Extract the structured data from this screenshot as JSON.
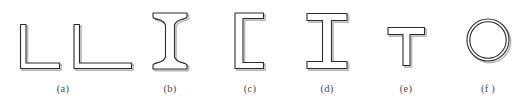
{
  "figure": {
    "background_color": "#ffffff",
    "outline_color": "#2b2b2b",
    "shadow_color": "#b9b9b9",
    "fill_color": "#ffffff",
    "stroke_width": 1.1,
    "width": 532,
    "height": 108
  },
  "captions": [
    {
      "id": "a",
      "label": "(a)",
      "x": 63,
      "shape_name": "angle-sections"
    },
    {
      "id": "b",
      "label": "(b)",
      "x": 170,
      "shape_name": "s-beam-section"
    },
    {
      "id": "c",
      "label": "(c)",
      "x": 250,
      "shape_name": "channel-section"
    },
    {
      "id": "d",
      "label": "(d)",
      "x": 327,
      "shape_name": "w-beam-section"
    },
    {
      "id": "e",
      "label": "(e)",
      "x": 406,
      "shape_name": "tee-section"
    },
    {
      "id": "f",
      "label": "(f )",
      "x": 488,
      "shape_name": "pipe-section"
    }
  ],
  "shapes": [
    {
      "name": "angle-equal-leg",
      "caption_id": "a",
      "description": "Equal-leg angle (L) cross section",
      "bbox": [
        19,
        24,
        41,
        45
      ],
      "path": "M 20.5 24.5 L 26.0 24.5 L 26.0 63.0 L 59.5 63.0 L 59.5 68.5 L 20.5 68.5 Z"
    },
    {
      "name": "angle-unequal-leg",
      "caption_id": "a",
      "description": "Unequal-leg angle (L) cross section",
      "bbox": [
        73,
        24,
        59,
        45
      ],
      "path": "M 74.0 24.5 L 79.5 24.5 L 79.5 63.0 L 131.5 63.0 L 131.5 68.5 L 74.0 68.5 Z"
    },
    {
      "name": "s-beam",
      "caption_id": "b",
      "description": "American Standard S-beam with sloped tapered flanges",
      "bbox": [
        152,
        12,
        36,
        58
      ],
      "path": "M 153.0 13.0 L 187.0 13.0 L 187.0 17.0 Q 186.5 18.5 182.0 19.4 Q 176.0 20.8 174.5 25.0 L 174.5 57.0 Q 176.0 61.2 182.0 62.6 Q 186.5 63.5 187.0 65.0 L 187.0 69.0 L 153.0 69.0 L 153.0 65.0 Q 153.5 63.5 158.0 62.6 Q 164.0 61.2 165.5 57.0 L 165.5 25.0 Q 164.0 20.8 158.0 19.4 Q 153.5 18.5 153.0 17.0 Z"
    },
    {
      "name": "channel",
      "caption_id": "c",
      "description": "Channel (C) cross section, open to the right",
      "bbox": [
        234,
        12,
        30,
        58
      ],
      "path": "M 235.0 13.0 L 263.5 13.0 L 263.5 18.5 L 243.0 18.5 L 243.0 62.5 L 263.5 62.5 L 263.5 68.5 L 235.0 68.5 Z"
    },
    {
      "name": "w-beam",
      "caption_id": "d",
      "description": "Wide-flange W-beam with parallel flanges",
      "bbox": [
        306,
        13,
        42,
        56
      ],
      "path": "M 307.0 13.5 L 347.0 13.5 L 347.0 20.5 L 331.5 20.5 L 331.5 61.5 L 347.0 61.5 L 347.0 68.5 L 307.0 68.5 L 307.0 61.5 L 322.5 61.5 L 322.5 20.5 L 307.0 20.5 Z"
    },
    {
      "name": "tee",
      "caption_id": "e",
      "description": "Structural tee (T) cross section",
      "bbox": [
        387,
        27,
        38,
        39
      ],
      "path": "M 388.0 27.5 L 424.5 27.5 L 424.5 34.5 L 410.0 34.5 L 410.0 65.5 L 403.0 65.5 L 403.0 34.5 L 388.0 34.5 Z"
    },
    {
      "name": "pipe",
      "caption_id": "f",
      "description": "Circular hollow structural section (pipe)",
      "bbox": [
        466,
        18,
        44,
        44
      ],
      "outer_circle": {
        "cx": 488,
        "cy": 40,
        "r": 21
      },
      "inner_circle": {
        "cx": 488,
        "cy": 40,
        "r": 18.2
      }
    }
  ]
}
